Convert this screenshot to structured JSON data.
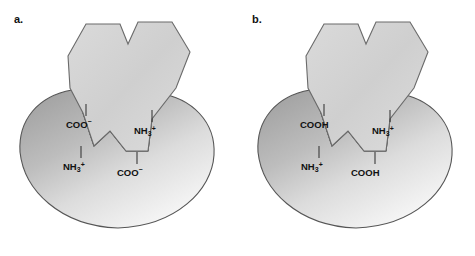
{
  "figure": {
    "background_color": "#ffffff",
    "width": 475,
    "height": 256
  },
  "colors": {
    "receptor_dark": "#a9a9a9",
    "receptor_light": "#f4f4f4",
    "ligand_fill": "#d2d2d2",
    "ligand_light": "#e6e6e6",
    "outline": "#4a4a4a",
    "text": "#111111"
  },
  "panels": [
    {
      "id": "a",
      "label": "a.",
      "receptor_name": "receptor-protein",
      "ligand_name": "ligand-molecule",
      "groups": [
        {
          "id": "a-ligand-left",
          "position": "ligand-left",
          "base": "COO",
          "sub": "",
          "sup": "–",
          "text": "COO–"
        },
        {
          "id": "a-ligand-right",
          "position": "ligand-right",
          "base": "NH",
          "sub": "3",
          "sup": "+",
          "text": "NH3+"
        },
        {
          "id": "a-receptor-left",
          "position": "receptor-left",
          "base": "NH",
          "sub": "3",
          "sup": "+",
          "text": "NH3+"
        },
        {
          "id": "a-receptor-right",
          "position": "receptor-right",
          "base": "COO",
          "sub": "",
          "sup": "–",
          "text": "COO–"
        }
      ]
    },
    {
      "id": "b",
      "label": "b.",
      "receptor_name": "receptor-protein",
      "ligand_name": "ligand-molecule",
      "groups": [
        {
          "id": "b-ligand-left",
          "position": "ligand-left",
          "base": "COOH",
          "sub": "",
          "sup": "",
          "text": "COOH"
        },
        {
          "id": "b-ligand-right",
          "position": "ligand-right",
          "base": "NH",
          "sub": "3",
          "sup": "+",
          "text": "NH3+"
        },
        {
          "id": "b-receptor-left",
          "position": "receptor-left",
          "base": "NH",
          "sub": "3",
          "sup": "+",
          "text": "NH3+"
        },
        {
          "id": "b-receptor-right",
          "position": "receptor-right",
          "base": "COOH",
          "sub": "",
          "sup": "",
          "text": "COOH"
        }
      ]
    }
  ]
}
